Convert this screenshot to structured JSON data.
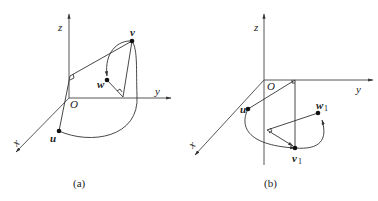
{
  "panels": [
    {
      "id": "a",
      "caption": "(a)",
      "axes": {
        "z": "z",
        "y": "y",
        "x": "x",
        "origin": "O"
      },
      "points": {
        "u": "u",
        "v": "v",
        "w": "w"
      }
    },
    {
      "id": "b",
      "caption": "(b)",
      "axes": {
        "z": "z",
        "y": "y",
        "x": "x",
        "origin": "O"
      },
      "points": {
        "u": "u",
        "v": "v",
        "v_sub": "1",
        "w": "w",
        "w_sub": "1"
      }
    }
  ],
  "colors": {
    "line": "#333333",
    "point": "#111111",
    "background": "#ffffff"
  }
}
